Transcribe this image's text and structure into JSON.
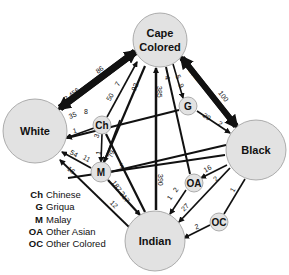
{
  "nodes": {
    "cape_colored": {
      "line1": "Cape",
      "line2": "Colored"
    },
    "white": {
      "label": "White"
    },
    "black": {
      "label": "Black"
    },
    "indian": {
      "label": "Indian"
    },
    "ch": {
      "label": "Ch"
    },
    "g": {
      "label": "G"
    },
    "m": {
      "label": "M"
    },
    "oa": {
      "label": "OA"
    },
    "oc": {
      "label": "OC"
    }
  },
  "edges": {
    "white_cape_to_white": "3,456",
    "white_cape_to_cape": "86",
    "ch_white_a": "35",
    "ch_white_b": "8",
    "ch_cape_a": "50",
    "ch_cape_b": "7",
    "ch_m": "3",
    "ch_m_b": "1",
    "white_g": "1",
    "cape_m": "92",
    "cape_indian": "385",
    "cape_oa": "4",
    "cape_g_a": "5",
    "cape_g_b": "9",
    "cape_black_to_cape": "1,827",
    "cape_black_to_black": "100",
    "g_black_a": "29",
    "g_black_b": "2",
    "white_m_a": "54",
    "white_m_b": "11",
    "white_indian": "16",
    "m_ch_cape": "79",
    "m_black": "5",
    "m_indian_a": "187",
    "m_indian_b": "217",
    "white_indian_b": "12",
    "indian_cape": "390",
    "oa_black": "16",
    "oa_indian_a": "1",
    "oa_indian_b": "2",
    "black_indian_a": "2",
    "black_indian_b": "27",
    "black_oc": "1",
    "oc_indian": "2"
  },
  "legend": [
    {
      "abbr": "Ch",
      "name": "Chinese"
    },
    {
      "abbr": "G",
      "name": "Griqua"
    },
    {
      "abbr": "M",
      "name": "Malay"
    },
    {
      "abbr": "OA",
      "name": "Other Asian"
    },
    {
      "abbr": "OC",
      "name": "Other Colored"
    }
  ],
  "colors": {
    "node_fill": "#e2e2e2",
    "node_stroke": "#9a9a9a",
    "edge": "#111111"
  }
}
